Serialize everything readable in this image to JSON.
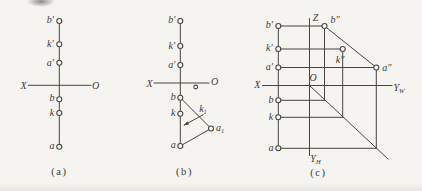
{
  "meta": {
    "width": 422,
    "height": 191,
    "paper_color": "#f5f4f0",
    "point_fill": "#faf9f5",
    "ink_color": "#46453f",
    "text_color": "#3c3b35",
    "label_font_size": 10,
    "sub_font_size": 6.5,
    "caption_font_size": 10.5,
    "point_radius": 2.5,
    "line_width": 1
  },
  "panels": [
    {
      "id": "a",
      "caption": {
        "t": "(a)",
        "x": 59.5,
        "y": 171.8
      },
      "lines": [
        {
          "n": "projection-line",
          "x1": 59.3,
          "y1": 21,
          "x2": 59.3,
          "y2": 146.7
        },
        {
          "n": "x-o-axis",
          "x1": 28.3,
          "y1": 85.3,
          "x2": 91,
          "y2": 85.3
        }
      ],
      "arrows": [],
      "points": [
        {
          "n": "pt-b-prime",
          "x": 59.3,
          "y": 21
        },
        {
          "n": "pt-k-prime",
          "x": 59.3,
          "y": 44.3
        },
        {
          "n": "pt-a-prime",
          "x": 59.3,
          "y": 62.7
        },
        {
          "n": "pt-b",
          "x": 59.3,
          "y": 99.3
        },
        {
          "n": "pt-k",
          "x": 59.3,
          "y": 113
        },
        {
          "n": "pt-a",
          "x": 59.3,
          "y": 146.7
        }
      ],
      "labels": [
        {
          "n": "lbl-b-prime",
          "t": "b′",
          "x": 50.3,
          "y": 19.7
        },
        {
          "n": "lbl-k-prime",
          "t": "k′",
          "x": 50.3,
          "y": 43.7
        },
        {
          "n": "lbl-a-prime",
          "t": "a′",
          "x": 50.3,
          "y": 62
        },
        {
          "n": "lbl-b",
          "t": "b",
          "x": 52,
          "y": 97.5
        },
        {
          "n": "lbl-k",
          "t": "k",
          "x": 52,
          "y": 112
        },
        {
          "n": "lbl-a",
          "t": "a",
          "x": 52,
          "y": 145.2
        },
        {
          "n": "lbl-axis-x",
          "t": "X",
          "x": 23.5,
          "y": 85.6
        },
        {
          "n": "lbl-axis-o",
          "t": "O",
          "x": 95.5,
          "y": 85.3
        }
      ]
    },
    {
      "id": "b",
      "caption": {
        "t": "(b)",
        "x": 184.5,
        "y": 171.8
      },
      "lines": [
        {
          "n": "projection-line",
          "x1": 180.3,
          "y1": 21,
          "x2": 180.3,
          "y2": 146
        },
        {
          "n": "x-o-axis",
          "x1": 154,
          "y1": 83,
          "x2": 209,
          "y2": 83
        },
        {
          "n": "b-a1-construction",
          "x1": 180.3,
          "y1": 97.7,
          "x2": 211,
          "y2": 128.5
        },
        {
          "n": "a-a1-construction",
          "x1": 180.3,
          "y1": 146,
          "x2": 211,
          "y2": 128.5
        }
      ],
      "arrows": [
        {
          "n": "rotation-arrow",
          "x1": 203.5,
          "y1": 114.5,
          "x2": 183.8,
          "y2": 125.3
        }
      ],
      "points": [
        {
          "n": "pt-b-prime",
          "x": 180.3,
          "y": 21
        },
        {
          "n": "pt-k-prime",
          "x": 180.3,
          "y": 46
        },
        {
          "n": "pt-a-prime",
          "x": 180.3,
          "y": 65
        },
        {
          "n": "pt-b",
          "x": 180.3,
          "y": 97.7
        },
        {
          "n": "pt-k",
          "x": 180.3,
          "y": 113.7
        },
        {
          "n": "pt-a",
          "x": 180.3,
          "y": 146
        },
        {
          "n": "pt-a1",
          "x": 211,
          "y": 128.5
        },
        {
          "n": "pt-unlabeled",
          "x": 195.7,
          "y": 87,
          "r": 1.9
        }
      ],
      "labels": [
        {
          "n": "lbl-b-prime",
          "t": "b′",
          "x": 171.8,
          "y": 19.7
        },
        {
          "n": "lbl-k-prime",
          "t": "k′",
          "x": 171.8,
          "y": 45.3
        },
        {
          "n": "lbl-a-prime",
          "t": "a′",
          "x": 171.8,
          "y": 64.3
        },
        {
          "n": "lbl-b",
          "t": "b",
          "x": 173.3,
          "y": 96.2
        },
        {
          "n": "lbl-k",
          "t": "k",
          "x": 173.3,
          "y": 112.5
        },
        {
          "n": "lbl-a",
          "t": "a",
          "x": 173.3,
          "y": 144.8
        },
        {
          "n": "lbl-axis-x",
          "t": "X",
          "x": 149.5,
          "y": 83.2
        },
        {
          "n": "lbl-axis-o",
          "t": "O",
          "x": 214.5,
          "y": 81
        },
        {
          "n": "lbl-k1",
          "t": "k",
          "sub": "1",
          "x": 203,
          "y": 108
        },
        {
          "n": "lbl-a1",
          "t": "a",
          "sub": "1",
          "x": 220,
          "y": 127.3
        }
      ]
    },
    {
      "id": "c",
      "caption": {
        "t": "(c)",
        "x": 318.5,
        "y": 172.5
      },
      "lines": [
        {
          "n": "left-projection-line",
          "x1": 278.3,
          "y1": 26,
          "x2": 278.3,
          "y2": 148.3
        },
        {
          "n": "z-axis",
          "x1": 309.5,
          "y1": 18.5,
          "x2": 309.5,
          "y2": 155.5
        },
        {
          "n": "x-yw-axis",
          "x1": 262.5,
          "y1": 85.5,
          "x2": 392,
          "y2": 85.5
        },
        {
          "n": "bprime-bdbl-link",
          "x1": 278.3,
          "y1": 26,
          "x2": 324.5,
          "y2": 26
        },
        {
          "n": "kprime-kdbl-link",
          "x1": 278.3,
          "y1": 49,
          "x2": 342.7,
          "y2": 49
        },
        {
          "n": "aprime-adbl-link",
          "x1": 278.3,
          "y1": 67.5,
          "x2": 376.3,
          "y2": 67.5
        },
        {
          "n": "bdbl-adbl-segment",
          "x1": 324.5,
          "y1": 26,
          "x2": 376.3,
          "y2": 67.5
        },
        {
          "n": "bdbl-vertical",
          "x1": 324.5,
          "y1": 26,
          "x2": 324.5,
          "y2": 100.3
        },
        {
          "n": "kdbl-vertical",
          "x1": 342.7,
          "y1": 49,
          "x2": 342.7,
          "y2": 117.3
        },
        {
          "n": "adbl-vertical",
          "x1": 376.3,
          "y1": 67.5,
          "x2": 376.3,
          "y2": 148.3
        },
        {
          "n": "b-horizontal",
          "x1": 278.3,
          "y1": 100.3,
          "x2": 324.5,
          "y2": 100.3
        },
        {
          "n": "k-horizontal",
          "x1": 278.3,
          "y1": 117.3,
          "x2": 342.7,
          "y2": 117.3
        },
        {
          "n": "a-horizontal",
          "x1": 278.3,
          "y1": 148.3,
          "x2": 376.3,
          "y2": 148.3
        },
        {
          "n": "miter-45-line",
          "x1": 309.5,
          "y1": 85.5,
          "x2": 388,
          "y2": 159
        }
      ],
      "arrows": [],
      "points": [
        {
          "n": "pt-b-prime",
          "x": 278.3,
          "y": 26
        },
        {
          "n": "pt-k-prime",
          "x": 278.3,
          "y": 49
        },
        {
          "n": "pt-a-prime",
          "x": 278.3,
          "y": 67.5
        },
        {
          "n": "pt-b",
          "x": 278.3,
          "y": 100.3
        },
        {
          "n": "pt-k",
          "x": 278.3,
          "y": 117.3
        },
        {
          "n": "pt-a",
          "x": 278.3,
          "y": 148.3
        },
        {
          "n": "pt-b-dblprime",
          "x": 324.5,
          "y": 26
        },
        {
          "n": "pt-k-dblprime",
          "x": 342.7,
          "y": 49
        },
        {
          "n": "pt-a-dblprime",
          "x": 376.3,
          "y": 67.5
        }
      ],
      "labels": [
        {
          "n": "lbl-b-prime",
          "t": "b′",
          "x": 269.3,
          "y": 24.7
        },
        {
          "n": "lbl-k-prime",
          "t": "k′",
          "x": 269.3,
          "y": 47.5
        },
        {
          "n": "lbl-a-prime",
          "t": "a′",
          "x": 269.3,
          "y": 66.2
        },
        {
          "n": "lbl-b",
          "t": "b",
          "x": 271,
          "y": 99
        },
        {
          "n": "lbl-k",
          "t": "k",
          "x": 271,
          "y": 116.2
        },
        {
          "n": "lbl-a",
          "t": "a",
          "x": 271,
          "y": 147
        },
        {
          "n": "lbl-b-dblprime",
          "t": "b″",
          "x": 335,
          "y": 19.3
        },
        {
          "n": "lbl-k-dblprime",
          "t": "k″",
          "x": 340,
          "y": 59.5
        },
        {
          "n": "lbl-a-dblprime",
          "t": "a″",
          "x": 386.8,
          "y": 67.2
        },
        {
          "n": "lbl-axis-z",
          "t": "Z",
          "x": 315.5,
          "y": 17.5
        },
        {
          "n": "lbl-origin-o",
          "t": "O",
          "x": 313,
          "y": 77.3
        },
        {
          "n": "lbl-axis-x",
          "t": "X",
          "x": 257.3,
          "y": 84.8
        },
        {
          "n": "lbl-axis-yw",
          "t": "Y",
          "sub": "W",
          "x": 399,
          "y": 87.2
        },
        {
          "n": "lbl-axis-yh",
          "t": "Y",
          "sub": "H",
          "x": 315.5,
          "y": 158.8
        }
      ]
    }
  ]
}
